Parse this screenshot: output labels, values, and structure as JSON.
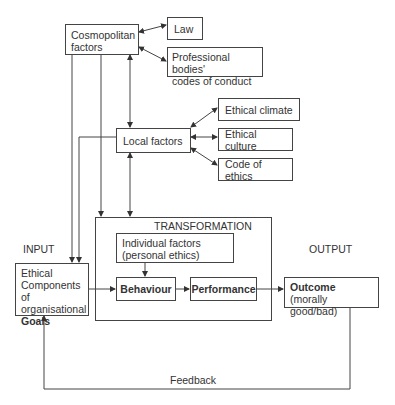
{
  "diagram": {
    "nodes": {
      "cosmopolitan": {
        "line1": "Cosmopolitan",
        "line2": "factors"
      },
      "law": {
        "label": "Law"
      },
      "professional": {
        "line1": "Professional bodies'",
        "line2": "codes of conduct"
      },
      "local": {
        "label": "Local factors"
      },
      "climate": {
        "label": "Ethical climate"
      },
      "culture": {
        "label": "Ethical culture"
      },
      "code": {
        "label": "Code of ethics"
      },
      "transformation": {
        "label": "TRANSFORMATION"
      },
      "individual": {
        "line1": "Individual factors",
        "line2": "(personal ethics)"
      },
      "behaviour": {
        "label": "Behaviour"
      },
      "performance": {
        "label": "Performance"
      },
      "goals": {
        "line1": "Ethical",
        "line2": "Components of",
        "line3": "organisational",
        "line4": "Goals"
      },
      "outcome": {
        "line1": "Outcome",
        "line2": "(morally good/bad)"
      }
    },
    "labels": {
      "input": "INPUT",
      "output": "OUTPUT",
      "feedback": "Feedback"
    },
    "colors": {
      "line": "#444444",
      "text": "#333333",
      "background": "#ffffff"
    }
  }
}
